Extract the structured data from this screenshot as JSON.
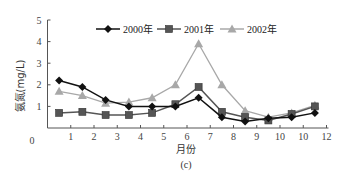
{
  "chart_data": {
    "type": "line",
    "title": "",
    "caption": "(c)",
    "xlabel": "月份",
    "ylabel": "氨氮(mg/L)",
    "xlim": [
      0,
      12
    ],
    "ylim": [
      0,
      5
    ],
    "x_tick_labels": [
      "0",
      "1",
      "2",
      "3",
      "4",
      "5",
      "6",
      "7",
      "8",
      "9",
      "10",
      "10",
      "12"
    ],
    "y_tick_labels": [
      "0",
      "1",
      "2",
      "3",
      "4",
      "5"
    ],
    "grid": false,
    "legend_position": "top-center",
    "x": [
      0.5,
      1.5,
      2.5,
      3.5,
      4.5,
      5.5,
      6.5,
      7.5,
      8.5,
      9.5,
      10.5,
      11.5
    ],
    "series": [
      {
        "name": "2000年",
        "marker": "diamond",
        "color": "#111111",
        "values": [
          2.2,
          1.9,
          1.3,
          1.0,
          1.0,
          1.0,
          1.4,
          0.5,
          0.3,
          0.45,
          0.5,
          0.7
        ]
      },
      {
        "name": "2001年",
        "marker": "square",
        "color": "#555555",
        "values": [
          0.7,
          0.75,
          0.6,
          0.6,
          0.7,
          1.1,
          1.9,
          0.75,
          0.5,
          0.35,
          0.65,
          1.0
        ]
      },
      {
        "name": "2002年",
        "marker": "triangle",
        "color": "#a8a8a8",
        "values": [
          1.7,
          1.5,
          1.15,
          1.2,
          1.4,
          2.0,
          3.9,
          2.0,
          0.8,
          0.5,
          0.7,
          1.05
        ]
      }
    ]
  }
}
